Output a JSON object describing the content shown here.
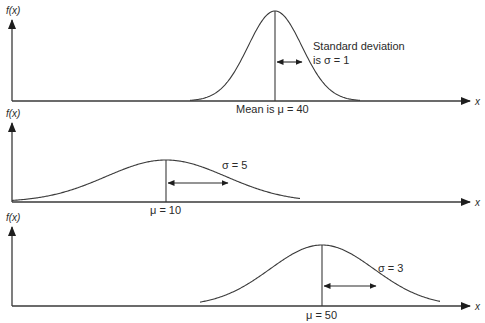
{
  "panels": [
    {
      "y_label": "f(x)",
      "x_label": "x",
      "mean": 40,
      "sigma": 1,
      "mean_label": "Mean is μ = 40",
      "sigma_label_line1": "Standard deviation",
      "sigma_label_line2": "is σ = 1"
    },
    {
      "y_label": "f(x)",
      "x_label": "x",
      "mean": 10,
      "sigma": 5,
      "mean_label": "μ = 10",
      "sigma_label_line1": "σ = 5"
    },
    {
      "y_label": "f(x)",
      "x_label": "x",
      "mean": 50,
      "sigma": 3,
      "mean_label": "μ = 50",
      "sigma_label_line1": "σ = 3"
    }
  ],
  "chart_data": [
    {
      "type": "line",
      "title": "Normal distribution",
      "mean": 40,
      "std": 1,
      "xlabel": "x",
      "ylabel": "f(x)"
    },
    {
      "type": "line",
      "title": "Normal distribution",
      "mean": 10,
      "std": 5,
      "xlabel": "x",
      "ylabel": "f(x)"
    },
    {
      "type": "line",
      "title": "Normal distribution",
      "mean": 50,
      "std": 3,
      "xlabel": "x",
      "ylabel": "f(x)"
    }
  ]
}
